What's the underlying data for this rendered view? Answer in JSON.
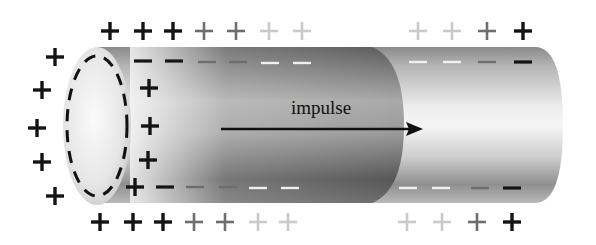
{
  "diagram": {
    "label": "impulse",
    "colors": {
      "ink": "#111111",
      "cylinder_light": "#f2f2f2",
      "cylinder_mid": "#bdbdbd",
      "cylinder_dark": "#6a6a6a",
      "depolarized_dark": "#4a4a4a",
      "fade_1": "#6e6e6e",
      "fade_2": "#c8c8c8"
    },
    "arrow": {
      "x1": 221,
      "y1": 129,
      "x2": 423,
      "y2": 129,
      "direction": "right"
    },
    "outer_top_plus": [
      {
        "x": 110,
        "y": 31,
        "shade": "dark"
      },
      {
        "x": 143,
        "y": 31,
        "shade": "dark"
      },
      {
        "x": 173,
        "y": 31,
        "shade": "dark"
      },
      {
        "x": 204,
        "y": 31,
        "shade": "mid"
      },
      {
        "x": 236,
        "y": 31,
        "shade": "mid"
      },
      {
        "x": 269,
        "y": 31,
        "shade": "light"
      },
      {
        "x": 302,
        "y": 31,
        "shade": "light"
      },
      {
        "x": 418,
        "y": 31,
        "shade": "light"
      },
      {
        "x": 452,
        "y": 31,
        "shade": "light"
      },
      {
        "x": 487,
        "y": 31,
        "shade": "mid"
      },
      {
        "x": 523,
        "y": 31,
        "shade": "dark"
      }
    ],
    "outer_bottom_plus": [
      {
        "x": 100,
        "y": 222,
        "shade": "dark"
      },
      {
        "x": 133,
        "y": 222,
        "shade": "dark"
      },
      {
        "x": 163,
        "y": 222,
        "shade": "dark"
      },
      {
        "x": 194,
        "y": 222,
        "shade": "mid"
      },
      {
        "x": 225,
        "y": 222,
        "shade": "mid"
      },
      {
        "x": 258,
        "y": 222,
        "shade": "light"
      },
      {
        "x": 288,
        "y": 222,
        "shade": "light"
      },
      {
        "x": 407,
        "y": 222,
        "shade": "light"
      },
      {
        "x": 442,
        "y": 222,
        "shade": "light"
      },
      {
        "x": 477,
        "y": 222,
        "shade": "mid"
      },
      {
        "x": 512,
        "y": 222,
        "shade": "dark"
      }
    ],
    "outer_left_plus": [
      {
        "x": 55,
        "y": 57
      },
      {
        "x": 42,
        "y": 90
      },
      {
        "x": 37,
        "y": 128
      },
      {
        "x": 42,
        "y": 162
      },
      {
        "x": 55,
        "y": 196
      }
    ],
    "inner_end_plus": [
      {
        "x": 149,
        "y": 88
      },
      {
        "x": 150,
        "y": 126
      },
      {
        "x": 148,
        "y": 160
      },
      {
        "x": 135,
        "y": 187
      }
    ],
    "inner_top_minus": [
      {
        "x": 143,
        "y": 61,
        "shade": "dark"
      },
      {
        "x": 174,
        "y": 61,
        "shade": "dark"
      },
      {
        "x": 207,
        "y": 62,
        "shade": "mid"
      },
      {
        "x": 238,
        "y": 62,
        "shade": "mid"
      },
      {
        "x": 270,
        "y": 63,
        "shade": "white"
      },
      {
        "x": 302,
        "y": 63,
        "shade": "white"
      },
      {
        "x": 418,
        "y": 62,
        "shade": "white"
      },
      {
        "x": 452,
        "y": 62,
        "shade": "white"
      },
      {
        "x": 487,
        "y": 62,
        "shade": "mid"
      },
      {
        "x": 523,
        "y": 62,
        "shade": "dark"
      }
    ],
    "inner_bottom_minus": [
      {
        "x": 165,
        "y": 187,
        "shade": "dark"
      },
      {
        "x": 195,
        "y": 187,
        "shade": "mid"
      },
      {
        "x": 228,
        "y": 187,
        "shade": "mid"
      },
      {
        "x": 258,
        "y": 188,
        "shade": "white"
      },
      {
        "x": 290,
        "y": 188,
        "shade": "white"
      },
      {
        "x": 408,
        "y": 188,
        "shade": "white"
      },
      {
        "x": 441,
        "y": 188,
        "shade": "white"
      },
      {
        "x": 480,
        "y": 188,
        "shade": "mid"
      },
      {
        "x": 512,
        "y": 188,
        "shade": "dark"
      }
    ]
  }
}
